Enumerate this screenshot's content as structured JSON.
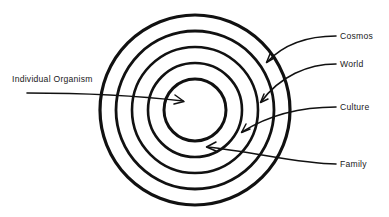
{
  "diagram": {
    "type": "concentric-rings",
    "background_color": "#ffffff",
    "stroke_color": "#111111",
    "center": {
      "x": 195,
      "y": 110
    },
    "rings": [
      {
        "name": "cosmos",
        "label": "Cosmos",
        "radius": 95,
        "stroke_width": 3.2,
        "order": 5
      },
      {
        "name": "world",
        "label": "World",
        "radius": 79,
        "stroke_width": 2.8,
        "order": 4
      },
      {
        "name": "culture",
        "label": "Culture",
        "radius": 63,
        "stroke_width": 2.6,
        "order": 3
      },
      {
        "name": "family",
        "label": "Family",
        "radius": 47,
        "stroke_width": 2.6,
        "order": 2
      },
      {
        "name": "individual-organism",
        "label": "Individual Organism",
        "radius": 31,
        "stroke_width": 3.0,
        "order": 1
      }
    ],
    "labels": {
      "individual_organism": "Individual Organism",
      "cosmos": "Cosmos",
      "world": "World",
      "culture": "Culture",
      "family": "Family"
    },
    "callouts": [
      {
        "name": "individual-organism",
        "label": "Individual Organism",
        "side": "left",
        "text_x": 12,
        "text_y": 82,
        "arrow_tip_x": 183,
        "arrow_tip_y": 101
      },
      {
        "name": "cosmos",
        "label": "Cosmos",
        "side": "right",
        "text_x": 340,
        "text_y": 39,
        "arrow_tip_x": 267,
        "arrow_tip_y": 61
      },
      {
        "name": "world",
        "label": "World",
        "side": "right",
        "text_x": 340,
        "text_y": 67,
        "arrow_tip_x": 261,
        "arrow_tip_y": 102
      },
      {
        "name": "culture",
        "label": "Culture",
        "side": "right",
        "text_x": 340,
        "text_y": 110,
        "arrow_tip_x": 242,
        "arrow_tip_y": 132
      },
      {
        "name": "family",
        "label": "Family",
        "side": "right",
        "text_x": 340,
        "text_y": 167,
        "arrow_tip_x": 207,
        "arrow_tip_y": 147
      }
    ]
  }
}
